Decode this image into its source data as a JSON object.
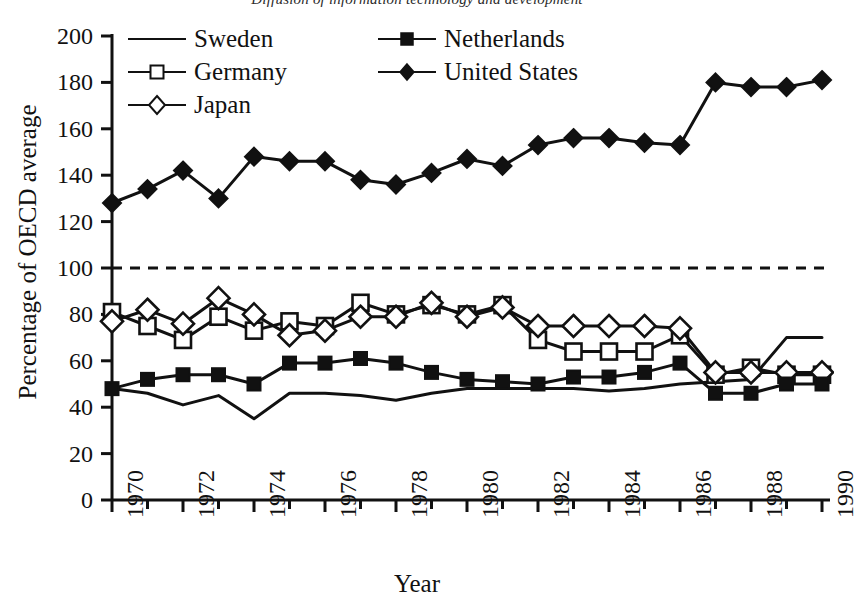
{
  "chart_data": {
    "type": "line",
    "title": "Diffusion of information technology and development",
    "xlabel": "Year",
    "ylabel": "Percentage of OECD average",
    "xlim": [
      1970,
      1990
    ],
    "ylim": [
      0,
      200
    ],
    "ytick_step": 20,
    "xtick_step": 1,
    "xtick_label_step": 2,
    "grid": false,
    "legend_position": "top-left-inside",
    "reference_line": {
      "value": 100,
      "style": "dashed",
      "label": ""
    },
    "ytick_labels": [
      "0",
      "20",
      "40",
      "60",
      "80",
      "100",
      "120",
      "140",
      "160",
      "180",
      "200"
    ],
    "xtick_labels": [
      "1970",
      "1972",
      "1974",
      "1976",
      "1978",
      "1980",
      "1982",
      "1984",
      "1986",
      "1988",
      "1990"
    ],
    "x": [
      1970,
      1971,
      1972,
      1973,
      1974,
      1975,
      1976,
      1977,
      1978,
      1979,
      1980,
      1981,
      1982,
      1983,
      1984,
      1985,
      1986,
      1987,
      1988,
      1989,
      1990
    ],
    "series": [
      {
        "name": "Sweden",
        "marker": "none",
        "fill": "none",
        "values": [
          48,
          46,
          41,
          45,
          35,
          46,
          46,
          45,
          43,
          46,
          48,
          48,
          48,
          48,
          47,
          48,
          50,
          51,
          52,
          70,
          70
        ]
      },
      {
        "name": "Germany",
        "marker": "square",
        "fill": "open",
        "values": [
          81,
          75,
          69,
          79,
          73,
          77,
          75,
          85,
          80,
          84,
          80,
          84,
          69,
          64,
          64,
          64,
          71,
          54,
          57,
          54,
          54
        ]
      },
      {
        "name": "Japan",
        "marker": "diamond",
        "fill": "open",
        "values": [
          77,
          82,
          76,
          87,
          80,
          71,
          73,
          79,
          79,
          85,
          79,
          83,
          75,
          75,
          75,
          75,
          74,
          55,
          55,
          55,
          55
        ]
      },
      {
        "name": "Netherlands",
        "marker": "square",
        "fill": "filled",
        "values": [
          48,
          52,
          54,
          54,
          50,
          59,
          59,
          61,
          59,
          55,
          52,
          51,
          50,
          53,
          53,
          55,
          59,
          46,
          46,
          50,
          50
        ]
      },
      {
        "name": "United States",
        "marker": "diamond",
        "fill": "filled",
        "values": [
          128,
          134,
          142,
          130,
          148,
          146,
          146,
          138,
          136,
          141,
          147,
          144,
          153,
          156,
          156,
          154,
          153,
          180,
          178,
          178,
          181
        ]
      }
    ]
  }
}
